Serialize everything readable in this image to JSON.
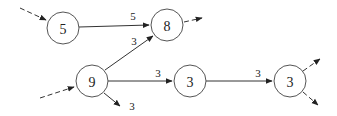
{
  "diagram": {
    "type": "weighted-directed-graph",
    "nodes": [
      {
        "id": "n5",
        "label": "5",
        "x": 63,
        "y": 28
      },
      {
        "id": "n8",
        "label": "8",
        "x": 167,
        "y": 25
      },
      {
        "id": "n9",
        "label": "9",
        "x": 92,
        "y": 81
      },
      {
        "id": "n3a",
        "label": "3",
        "x": 190,
        "y": 81
      },
      {
        "id": "n3b",
        "label": "3",
        "x": 290,
        "y": 81
      }
    ],
    "edges": [
      {
        "from": "n5",
        "to": "n8",
        "label": "5",
        "style": "solid"
      },
      {
        "from": "n9",
        "to": "n8",
        "label": "3",
        "style": "solid"
      },
      {
        "from": "n9",
        "to": "n3a",
        "label": "3",
        "style": "solid"
      },
      {
        "from": "n3a",
        "to": "n3b",
        "label": "3",
        "style": "solid"
      },
      {
        "from": "n9",
        "to": "out",
        "label": "3",
        "style": "solid"
      }
    ],
    "dangling_edges": [
      {
        "attached_to": "n5",
        "direction": "incoming",
        "style": "dashed"
      },
      {
        "attached_to": "n8",
        "direction": "outgoing",
        "style": "dashed"
      },
      {
        "attached_to": "n9",
        "direction": "incoming",
        "style": "dashed"
      },
      {
        "attached_to": "n3b",
        "direction": "outgoing-up",
        "style": "dashed"
      },
      {
        "attached_to": "n3b",
        "direction": "outgoing-down",
        "style": "dashed"
      }
    ],
    "labels": {
      "node_5": "5",
      "node_8": "8",
      "node_9": "9",
      "node_3a": "3",
      "node_3b": "3",
      "edge_5_8": "5",
      "edge_9_8": "3",
      "edge_9_3a": "3",
      "edge_3a_3b": "3",
      "edge_9_out": "3"
    }
  }
}
